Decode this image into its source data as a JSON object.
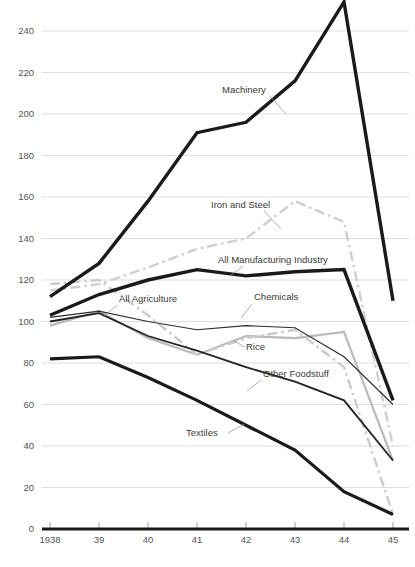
{
  "chart_data": {
    "type": "line",
    "title": "",
    "subtitle": "",
    "xlabel": "",
    "ylabel": "",
    "x": [
      "1938",
      "39",
      "40",
      "41",
      "42",
      "43",
      "44",
      "45"
    ],
    "xtick_labels": [
      "1938",
      "39",
      "40",
      "41",
      "42",
      "43",
      "44",
      "45"
    ],
    "ytick_labels": [
      "0",
      "20",
      "40",
      "60",
      "80",
      "100",
      "120",
      "140",
      "160",
      "180",
      "200",
      "220",
      "240"
    ],
    "ylim": [
      0,
      248
    ],
    "yticks": [
      0,
      20,
      40,
      60,
      80,
      100,
      120,
      140,
      160,
      180,
      200,
      220,
      240
    ],
    "grid": true,
    "legend_position": "inline-annotations",
    "series": [
      {
        "name": "Machinery",
        "label": "Machinery",
        "style": "thick-black-solid",
        "color": "#1a1a1a",
        "width": 3.4,
        "dash": "none",
        "values": [
          112,
          128,
          158,
          191,
          196,
          216,
          254,
          110
        ],
        "label_x": 222,
        "label_y": 93,
        "leader": "M 270 96 L 286 114"
      },
      {
        "name": "Iron and Steel",
        "label": "Iron and Steel",
        "style": "gray-dashdot",
        "color": "#cfcfcf",
        "width": 2.4,
        "dash": "10,4,2.5,4",
        "values": [
          115,
          118,
          126,
          135,
          140,
          158,
          148,
          40
        ],
        "label_x": 211,
        "label_y": 208,
        "leader": "M 264 211 L 281 229"
      },
      {
        "name": "All Manufacturing Industry",
        "label": "All Manufacturing Industry",
        "style": "thick-black-solid",
        "color": "#1a1a1a",
        "width": 3.4,
        "dash": "none",
        "values": [
          103,
          113,
          120,
          125,
          122,
          124,
          125,
          62
        ],
        "label_x": 218,
        "label_y": 263,
        "leader": "M 243 266 L 230 276"
      },
      {
        "name": "Chemicals",
        "label": "Chemicals",
        "style": "gray-dashdot",
        "color": "#cbcbcb",
        "width": 2.4,
        "dash": "10,4,2.5,4",
        "values": [
          118,
          120,
          103,
          84,
          92,
          96,
          78,
          7
        ],
        "label_x": 254,
        "label_y": 300,
        "leader": "M 252 304 L 241 318"
      },
      {
        "name": "All Agriculture",
        "label": "All Agriculture",
        "style": "thin-black-solid",
        "color": "#2c2c2c",
        "width": 1.1,
        "dash": "none",
        "values": [
          102,
          105,
          100,
          96,
          98,
          97,
          83,
          60
        ],
        "label_x": 119,
        "label_y": 302,
        "leader": "M 117 305 L 103 317"
      },
      {
        "name": "Rice",
        "label": "Rice",
        "style": "light-gray-solid",
        "color": "#b9b9b9",
        "width": 2.2,
        "dash": "none",
        "values": [
          98,
          105,
          92,
          84,
          93,
          92,
          95,
          33
        ],
        "label_x": 246,
        "label_y": 350,
        "leader": "M 244 347 L 233 340"
      },
      {
        "name": "Other Foodstuff",
        "label": "Other Foodstuff",
        "style": "medium-black-solid",
        "color": "#222222",
        "width": 1.8,
        "dash": "none",
        "values": [
          100,
          104,
          93,
          86,
          78,
          71,
          62,
          33
        ],
        "label_x": 263,
        "label_y": 377,
        "leader": "M 261 380 L 247 391"
      },
      {
        "name": "Textiles",
        "label": "Textiles",
        "style": "thick-black-solid",
        "color": "#1a1a1a",
        "width": 3.2,
        "dash": "none",
        "values": [
          82,
          83,
          73,
          62,
          50,
          38,
          18,
          7
        ],
        "label_x": 186,
        "label_y": 436,
        "leader": "M 228 433 L 244 424"
      }
    ]
  },
  "axis": {
    "y_labels": [
      "240",
      "220",
      "200",
      "180",
      "160",
      "140",
      "120",
      "100",
      "80",
      "60",
      "40",
      "20",
      "0"
    ],
    "x_labels": [
      "1938",
      "39",
      "40",
      "41",
      "42",
      "43",
      "44",
      "45"
    ]
  },
  "caption": {
    "text": ""
  }
}
